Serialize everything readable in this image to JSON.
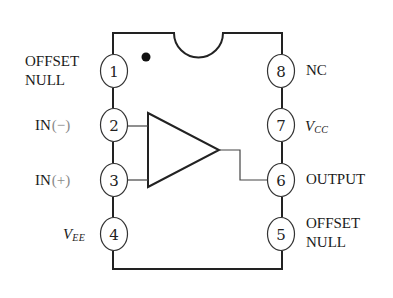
{
  "diagram": {
    "type": "IC pinout",
    "package": "8-pin DIP",
    "component": "op-amp",
    "colors": {
      "stroke": "#222222",
      "text": "#1a1a1a",
      "sign_text": "#8a8a8a",
      "background": "#ffffff"
    },
    "pins": [
      {
        "number": "1",
        "side": "left",
        "label_line1": "OFFSET",
        "label_line2": "NULL"
      },
      {
        "number": "2",
        "side": "left",
        "label": "IN",
        "sign": "(−)"
      },
      {
        "number": "3",
        "side": "left",
        "label": "IN",
        "sign": "(+)"
      },
      {
        "number": "4",
        "side": "left",
        "label": "V",
        "subscript": "EE"
      },
      {
        "number": "5",
        "side": "right",
        "label_line1": "OFFSET",
        "label_line2": "NULL"
      },
      {
        "number": "6",
        "side": "right",
        "label": "OUTPUT"
      },
      {
        "number": "7",
        "side": "right",
        "label": "V",
        "subscript": "CC"
      },
      {
        "number": "8",
        "side": "right",
        "label": "NC"
      }
    ],
    "features": {
      "pin1_indicator": "dot",
      "orientation_notch": "top-center semicircle",
      "symbol": "triangle amplifier, inputs pins 2 and 3, output pin 6"
    }
  }
}
